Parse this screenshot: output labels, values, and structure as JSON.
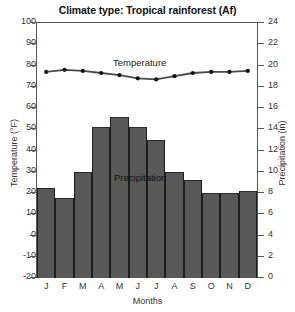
{
  "chart_data": {
    "type": "bar",
    "title": "Climate type: Tropical rainforest (Af)",
    "xlabel": "Months",
    "ylabel": "Temperature (°F)",
    "ylabel_right": "Precipitation (in)",
    "categories": [
      "J",
      "F",
      "M",
      "A",
      "M",
      "J",
      "J",
      "A",
      "S",
      "O",
      "N",
      "D"
    ],
    "ylim": [
      -20,
      100
    ],
    "yticks": [
      100,
      90,
      80,
      70,
      60,
      50,
      40,
      30,
      20,
      10,
      0,
      -10,
      -20
    ],
    "ylim_right": [
      0,
      24
    ],
    "yticks_right": [
      24,
      22,
      20,
      18,
      16,
      14,
      12,
      10,
      8,
      6,
      4,
      2,
      0
    ],
    "grid": false,
    "legend_position": "inline-annotation",
    "series": [
      {
        "name": "Precipitation",
        "type": "bar",
        "axis": "right",
        "unit": "in",
        "values": [
          8.5,
          7.5,
          10.0,
          14.2,
          15.2,
          14.2,
          13.0,
          10.0,
          9.2,
          8.0,
          8.0,
          8.2
        ]
      },
      {
        "name": "Temperature",
        "type": "line",
        "axis": "left",
        "unit": "°F",
        "values": [
          76.5,
          77.5,
          77.0,
          76.0,
          75.0,
          73.5,
          73.0,
          74.5,
          76.0,
          76.5,
          76.5,
          77.0
        ]
      }
    ],
    "annotations": [
      {
        "text": "Temperature",
        "series": "Temperature"
      },
      {
        "text": "Precipitation",
        "series": "Precipitation"
      }
    ],
    "colors": {
      "bar_fill": "#585858",
      "bar_edge": "#1d1d1d",
      "line": "#4a4a4a",
      "marker": "#111111",
      "axis": "#555555",
      "text": "#333333",
      "background": "#ffffff"
    }
  }
}
